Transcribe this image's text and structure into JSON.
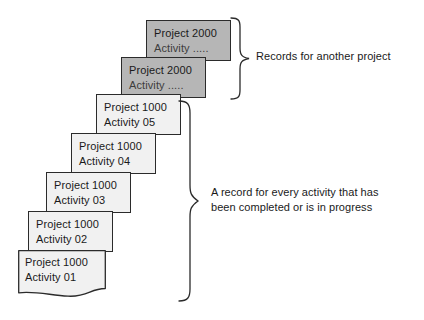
{
  "figure": {
    "background_color": "#ffffff",
    "card_border_color": "#2b2b2b",
    "card_light_fill": "#f1f1f1",
    "card_shaded_fill": "#b6b6b6",
    "text_color": "#1a1a1a"
  },
  "cards": [
    {
      "id": "project-2000-activity-top",
      "line1": "Project 2000",
      "line2": "Activity .....",
      "style": "shaded",
      "x": 146,
      "y": 20,
      "w": 85,
      "h": 41
    },
    {
      "id": "project-2000-activity-second",
      "line1": "Project 2000",
      "line2": "Activity .....",
      "style": "shaded",
      "x": 121,
      "y": 57,
      "w": 85,
      "h": 41
    },
    {
      "id": "project-1000-activity-05",
      "line1": "Project 1000",
      "line2": "Activity 05",
      "style": "light",
      "x": 96,
      "y": 94,
      "w": 85,
      "h": 41
    },
    {
      "id": "project-1000-activity-04",
      "line1": "Project 1000",
      "line2": "Activity 04",
      "style": "light",
      "x": 71,
      "y": 133,
      "w": 85,
      "h": 41
    },
    {
      "id": "project-1000-activity-03",
      "line1": "Project 1000",
      "line2": "Activity 03",
      "style": "light",
      "x": 46,
      "y": 172,
      "w": 85,
      "h": 41
    },
    {
      "id": "project-1000-activity-02",
      "line1": "Project 1000",
      "line2": "Activity 02",
      "style": "light",
      "x": 28,
      "y": 211,
      "w": 85,
      "h": 41
    },
    {
      "id": "project-1000-activity-01",
      "line1": "Project 1000",
      "line2": "Activity 01",
      "style": "light-torn",
      "x": 18,
      "y": 250,
      "w": 88,
      "h": 48
    }
  ],
  "annotations": {
    "upper": {
      "text": "Records for another project",
      "x": 256,
      "y": 49
    },
    "lower": {
      "line1": "A record for every activity that has",
      "line2": "been completed or is in progress",
      "text": "A record for every activity that has\nbeen completed or is in progress",
      "x": 211,
      "y": 185
    }
  },
  "braces": {
    "upper": {
      "top": 18,
      "bottom": 97,
      "tip_x": 249,
      "tip_y": 57
    },
    "lower": {
      "top": 101,
      "bottom": 302,
      "tip_x": 198,
      "tip_y": 201
    }
  }
}
